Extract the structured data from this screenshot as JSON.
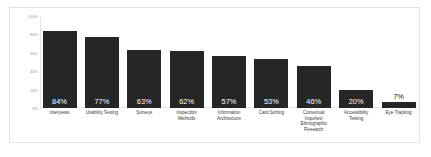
{
  "chart_data": {
    "type": "bar",
    "title": "",
    "subtitle": "",
    "xlabel": "",
    "ylabel": "",
    "ylim": [
      0,
      100
    ],
    "grid": false,
    "legend": null,
    "y_ticks": [
      "0%",
      "20%",
      "40%",
      "60%",
      "80%",
      "100%"
    ],
    "y_tick_values": [
      0,
      20,
      40,
      60,
      80,
      100
    ],
    "bar_color": "#262626",
    "categories": [
      "Interviews",
      "Usability Testing",
      "Surveys",
      "Inspection Methods",
      "Information Architecture",
      "Card Sorting",
      "Contextual Inquiries/ Ethnographic Research",
      "Accessibility Testing",
      "Eye Tracking"
    ],
    "values": [
      84,
      77,
      63,
      62,
      57,
      53,
      46,
      20,
      7
    ],
    "data_labels": [
      "84%",
      "77%",
      "63%",
      "62%",
      "57%",
      "53%",
      "46%",
      "20%",
      "7%"
    ]
  },
  "card": {
    "background": "#ffffff",
    "border_color": "#e3e3e3"
  },
  "axis": {
    "line_color": "#e6e6e6",
    "tick_label_color": "#9a9a9a",
    "category_label_color": "#3d3d3d"
  }
}
